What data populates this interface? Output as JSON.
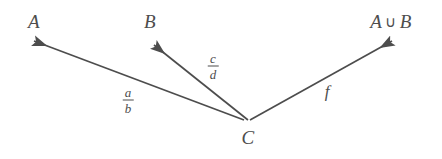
{
  "diagram": {
    "type": "commutative-diagram",
    "background_color": "#ffffff",
    "stroke_color": "#4d4d4d",
    "text_color": "#4d4d4d",
    "nodes": [
      {
        "id": "A",
        "label": "A",
        "x": 34,
        "y": 22
      },
      {
        "id": "B",
        "label": "B",
        "x": 150,
        "y": 22
      },
      {
        "id": "AunionB",
        "label_left": "A",
        "label_op": "∪",
        "label_right": "B",
        "x": 391,
        "y": 22
      },
      {
        "id": "C",
        "label": "C",
        "x": 248,
        "y": 138
      }
    ],
    "arrows": [
      {
        "id": "C-to-A",
        "from": "C",
        "to": "A",
        "label_numerator": "a",
        "label_denominator": "b",
        "label_x": 128,
        "label_y": 100,
        "label_kind": "fraction"
      },
      {
        "id": "C-to-B",
        "from": "C",
        "to": "B",
        "label_numerator": "c",
        "label_denominator": "d",
        "label_x": 213,
        "label_y": 66,
        "label_kind": "fraction"
      },
      {
        "id": "C-to-AunionB",
        "from": "C",
        "to": "AunionB",
        "label": "f",
        "label_x": 327,
        "label_y": 91,
        "label_kind": "plain"
      }
    ]
  }
}
